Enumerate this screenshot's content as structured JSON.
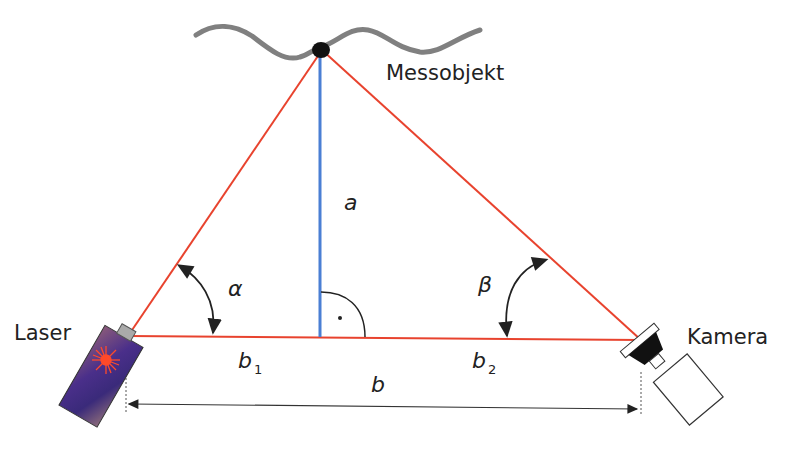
{
  "diagram": {
    "type": "laser-triangulation",
    "labels": {
      "object": "Messobjekt",
      "laser": "Laser",
      "camera": "Kamera",
      "height": "a",
      "alpha": "α",
      "beta": "β",
      "b1_base": "b",
      "b1_sub": "1",
      "b2_base": "b",
      "b2_sub": "2",
      "baseline": "b"
    },
    "colors": {
      "beam": "#e8432e",
      "height_line": "#4a7fd4",
      "surface": "#808080",
      "text": "#222222",
      "laser_body": "#5a3a8a",
      "point": "#111111"
    },
    "geometry": {
      "apex": [
        320,
        50
      ],
      "laser_point": [
        128,
        336
      ],
      "camera_point": [
        640,
        340
      ],
      "foot": [
        320,
        337
      ]
    },
    "icons": [
      "laser-device-icon",
      "camera-device-icon",
      "right-angle-marker-icon",
      "angle-arrow-icon"
    ]
  }
}
